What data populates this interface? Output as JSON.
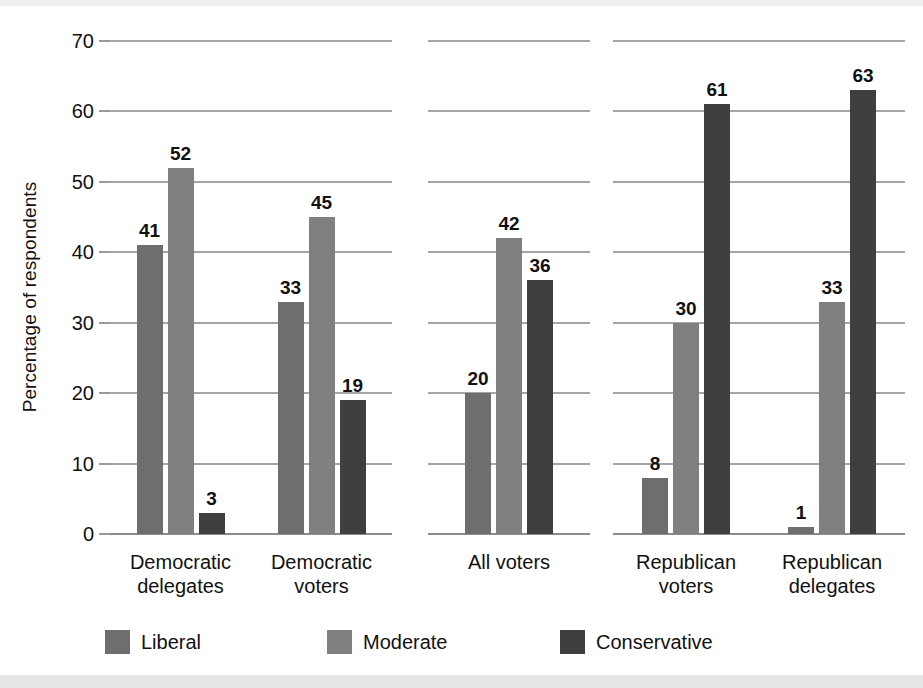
{
  "chart_data": {
    "type": "bar",
    "title": "",
    "subtitle": "",
    "xlabel": "",
    "ylabel": "Percentage of respondents",
    "ylim": [
      0,
      70
    ],
    "yticks": [
      0,
      10,
      20,
      30,
      40,
      50,
      60,
      70
    ],
    "ytick_labels": [
      "0",
      "10",
      "20",
      "30",
      "40",
      "50",
      "60",
      "70"
    ],
    "grid": "horizontal",
    "legend_position": "bottom",
    "categories": [
      "Democratic\ndelegates",
      "Democratic\nvoters",
      "All voters",
      "Republican\nvoters",
      "Republican\ndelegates"
    ],
    "series": [
      {
        "name": "Liberal",
        "color": "#6e6e6e",
        "values": [
          41,
          33,
          20,
          8,
          1
        ]
      },
      {
        "name": "Moderate",
        "color": "#808080",
        "values": [
          52,
          45,
          42,
          30,
          33
        ]
      },
      {
        "name": "Conservative",
        "color": "#3f3f3f",
        "values": [
          3,
          19,
          36,
          61,
          63
        ]
      }
    ],
    "panels": [
      {
        "name": "democratic-panel",
        "categories": [
          "Democratic\ndelegates",
          "Democratic\nvoters"
        ]
      },
      {
        "name": "all-voters-panel",
        "categories": [
          "All voters"
        ]
      },
      {
        "name": "republican-panel",
        "categories": [
          "Republican\nvoters",
          "Republican\ndelegates"
        ]
      }
    ]
  },
  "legend": {
    "items": [
      {
        "label": "Liberal",
        "color": "#6e6e6e"
      },
      {
        "label": "Moderate",
        "color": "#808080"
      },
      {
        "label": "Conservative",
        "color": "#3f3f3f"
      }
    ]
  }
}
